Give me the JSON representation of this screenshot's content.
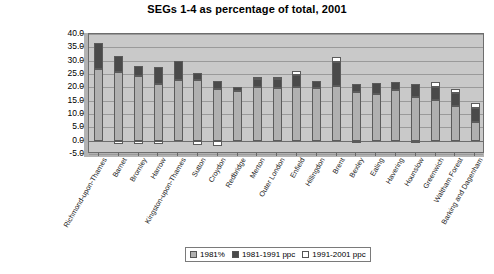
{
  "chart_data": {
    "type": "bar",
    "subtype": "stacked",
    "title": "SEGs 1-4 as percentage of total, 2001",
    "xlabel": "",
    "ylabel": "",
    "ylim": [
      -5.0,
      40.0
    ],
    "ytick_step": 5.0,
    "yticks": [
      "40.0",
      "35.0",
      "30.0",
      "25.0",
      "20.0",
      "15.0",
      "10.0",
      "5.0",
      "0.0",
      "-5.0"
    ],
    "grid": true,
    "legend_position": "bottom-center",
    "categories": [
      "Richmond-upon-Thames",
      "Barnet",
      "Bromley",
      "Harrow",
      "Kingston-upon-Thames",
      "Sutton",
      "Croydon",
      "Redbridge",
      "Merton",
      "Outer London",
      "Enfield",
      "Hillingdon",
      "Brent",
      "Bexley",
      "Ealing",
      "Havering",
      "Hounslow",
      "Greenwich",
      "Waltham Forest",
      "Barking and Dagenham"
    ],
    "series": [
      {
        "name": "1981%",
        "color": "#b0b0b0",
        "values": [
          26.8,
          25.6,
          24.3,
          21.4,
          22.9,
          22.6,
          19.2,
          18.5,
          20.3,
          19.7,
          20.1,
          19.8,
          20.6,
          18.1,
          17.6,
          19.0,
          16.5,
          15.2,
          13.1,
          6.9
        ]
      },
      {
        "name": "1981-1991 ppc",
        "color": "#4a4a4a",
        "values": [
          9.8,
          6.0,
          3.8,
          6.2,
          6.8,
          2.9,
          3.0,
          1.8,
          3.0,
          3.4,
          4.6,
          2.4,
          8.8,
          3.0,
          4.2,
          3.0,
          4.8,
          5.1,
          4.6,
          5.5
        ]
      },
      {
        "name": "1991-2001 ppc",
        "color": "#ffffff",
        "values": [
          0.0,
          -1.2,
          -1.3,
          -1.4,
          0.0,
          -1.5,
          -2.1,
          0.0,
          0.7,
          0.6,
          1.6,
          0.0,
          1.9,
          -0.7,
          0.0,
          0.0,
          -1.0,
          1.7,
          1.5,
          1.8
        ]
      }
    ],
    "bar_tops": [
      36.6,
      31.6,
      28.1,
      27.6,
      29.7,
      25.5,
      22.2,
      20.3,
      23.3,
      23.1,
      24.7,
      22.2,
      29.4,
      21.1,
      21.8,
      22.0,
      21.3,
      22.0,
      19.2,
      14.2
    ]
  },
  "legend": {
    "items": [
      {
        "label": "1981%",
        "swatch": "gray-swatch"
      },
      {
        "label": "1981-1991 ppc",
        "swatch": "dark-swatch"
      },
      {
        "label": "1991-2001 ppc",
        "swatch": "white-swatch"
      }
    ]
  }
}
